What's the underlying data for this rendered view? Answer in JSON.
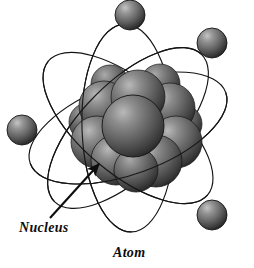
{
  "figure": {
    "title": "Atom",
    "background_color": "#ffffff",
    "width": 254,
    "height": 268,
    "line_color": "#111111",
    "labels": {
      "nucleus": "Nucleus",
      "atom": "Atom"
    },
    "annotation": {
      "arrow_name": "nucleus-pointer-arrow",
      "from_x": 50,
      "from_y": 218,
      "to_x": 100,
      "to_y": 163
    },
    "nucleus": {
      "name": "nucleus",
      "center_x": 135,
      "center_y": 128,
      "radius": 52,
      "particle_count": 12,
      "fill_light": "#9a9a9a",
      "fill_mid": "#6e6e6e",
      "fill_dark": "#2e2e2e",
      "particles": [
        {
          "cx": 138,
          "cy": 97,
          "r": 26
        },
        {
          "cx": 104,
          "cy": 106,
          "r": 25
        },
        {
          "cx": 170,
          "cy": 108,
          "r": 25
        },
        {
          "cx": 133,
          "cy": 126,
          "r": 30
        },
        {
          "cx": 97,
          "cy": 140,
          "r": 26
        },
        {
          "cx": 176,
          "cy": 140,
          "r": 26
        },
        {
          "cx": 116,
          "cy": 158,
          "r": 25
        },
        {
          "cx": 155,
          "cy": 160,
          "r": 26
        },
        {
          "cx": 136,
          "cy": 168,
          "r": 22
        },
        {
          "cx": 160,
          "cy": 84,
          "r": 19
        },
        {
          "cx": 110,
          "cy": 84,
          "r": 18
        },
        {
          "cx": 183,
          "cy": 124,
          "r": 18
        }
      ]
    },
    "electrons": [
      {
        "name": "electron-top",
        "cx": 130,
        "cy": 15,
        "r": 15
      },
      {
        "name": "electron-upper-right",
        "cx": 212,
        "cy": 43,
        "r": 15
      },
      {
        "name": "electron-left",
        "cx": 22,
        "cy": 130,
        "r": 15
      },
      {
        "name": "electron-bottom-right",
        "cx": 212,
        "cy": 215,
        "r": 15
      }
    ],
    "orbits": [
      {
        "name": "orbit-1",
        "rx": 104,
        "ry": 46,
        "rotation": -20,
        "cx": 128,
        "cy": 128
      },
      {
        "name": "orbit-2",
        "rx": 104,
        "ry": 46,
        "rotation": 40,
        "cx": 128,
        "cy": 128
      },
      {
        "name": "orbit-3",
        "rx": 104,
        "ry": 46,
        "rotation": 88,
        "cx": 128,
        "cy": 128
      },
      {
        "name": "orbit-4",
        "rx": 104,
        "ry": 46,
        "rotation": 135,
        "cx": 128,
        "cy": 128
      }
    ]
  }
}
